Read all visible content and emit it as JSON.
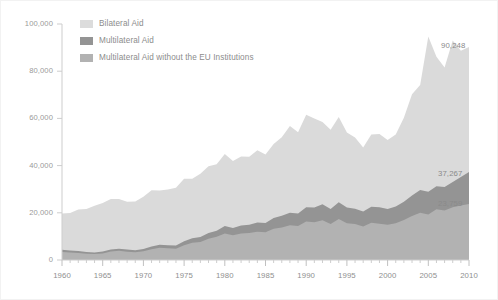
{
  "chart_data": {
    "type": "area",
    "stacked": true,
    "title": "",
    "subtitle": "",
    "xlabel": "",
    "ylabel": "",
    "xlim": [
      1960,
      2010
    ],
    "ylim": [
      0,
      100000
    ],
    "grid": false,
    "legend_position": "top-left",
    "x_ticks": [
      "1960",
      "1965",
      "1970",
      "1975",
      "1980",
      "1985",
      "1990",
      "1995",
      "2000",
      "2005",
      "2010"
    ],
    "x_tick_values": [
      1960,
      1965,
      1970,
      1975,
      1980,
      1985,
      1990,
      1995,
      2000,
      2005,
      2010
    ],
    "x_minor_tick_interval": 1,
    "y_ticks": [
      "0",
      "20,000",
      "40,000",
      "60,000",
      "80,000",
      "100,000"
    ],
    "y_tick_values": [
      0,
      20000,
      40000,
      60000,
      80000,
      100000
    ],
    "x": [
      1960,
      1961,
      1962,
      1963,
      1964,
      1965,
      1966,
      1967,
      1968,
      1969,
      1970,
      1971,
      1972,
      1973,
      1974,
      1975,
      1976,
      1977,
      1978,
      1979,
      1980,
      1981,
      1982,
      1983,
      1984,
      1985,
      1986,
      1987,
      1988,
      1989,
      1990,
      1991,
      1992,
      1993,
      1994,
      1995,
      1996,
      1997,
      1998,
      1999,
      2000,
      2001,
      2002,
      2003,
      2004,
      2005,
      2006,
      2007,
      2008,
      2009,
      2010
    ],
    "series": [
      {
        "name": "Multilateral Aid without the EU Institutions",
        "color": "#b2b2b2",
        "values": [
          3400,
          3200,
          3000,
          2700,
          2500,
          2800,
          3600,
          3900,
          3500,
          3300,
          3700,
          4600,
          5200,
          5000,
          4800,
          6300,
          7300,
          7600,
          9000,
          9800,
          11200,
          10500,
          11200,
          11400,
          12000,
          11800,
          13200,
          13800,
          14700,
          14400,
          16300,
          16000,
          16800,
          15300,
          17400,
          15600,
          15300,
          14200,
          15800,
          15400,
          14900,
          15600,
          17000,
          18600,
          20000,
          19300,
          21500,
          21000,
          22400,
          23100,
          23759
        ]
      },
      {
        "name": "Multilateral Aid",
        "color": "#949494",
        "values": [
          4300,
          4000,
          3800,
          3400,
          3200,
          3600,
          4500,
          4800,
          4400,
          4100,
          4700,
          5700,
          6500,
          6300,
          6100,
          7900,
          9200,
          9700,
          11400,
          12400,
          14400,
          13600,
          14600,
          14900,
          15900,
          15700,
          17800,
          18700,
          20000,
          19700,
          22400,
          22200,
          23600,
          21600,
          24500,
          22200,
          21700,
          20500,
          22600,
          22300,
          21600,
          22700,
          24700,
          27300,
          29700,
          28900,
          31300,
          30900,
          33100,
          35200,
          37267
        ]
      },
      {
        "name": "Bilateral Aid",
        "color": "#dadada",
        "values": [
          15400,
          15900,
          17600,
          18200,
          19800,
          20600,
          21400,
          21100,
          20300,
          20700,
          22100,
          23900,
          23000,
          23600,
          24500,
          26500,
          25200,
          26800,
          28300,
          28200,
          30500,
          28300,
          29300,
          28800,
          30600,
          29000,
          31400,
          33300,
          36800,
          34400,
          39100,
          37800,
          34900,
          33600,
          36100,
          31800,
          30200,
          27200,
          30600,
          31100,
          29300,
          30500,
          35600,
          42900,
          44400,
          65800,
          54800,
          50700,
          59900,
          53500,
          52981
        ]
      }
    ],
    "stack_totals": [
      19700,
      19900,
      21400,
      21600,
      23000,
      24200,
      25900,
      25900,
      24700,
      24800,
      26800,
      29600,
      29500,
      29900,
      30600,
      34400,
      34400,
      36500,
      39700,
      40600,
      44900,
      41900,
      43900,
      43700,
      46500,
      44700,
      49200,
      52000,
      56800,
      54100,
      61500,
      60000,
      58500,
      55200,
      60600,
      54000,
      51900,
      47700,
      53200,
      53400,
      50900,
      53200,
      60300,
      70200,
      74100,
      94700,
      86100,
      81600,
      93000,
      88700,
      90248
    ],
    "value_labels": [
      {
        "text": "90,248",
        "series": "total",
        "year": 2010,
        "value": 90248
      },
      {
        "text": "37,267",
        "series": "Multilateral Aid",
        "year": 2010,
        "value": 37267
      },
      {
        "text": "23,759",
        "series": "Multilateral Aid without the EU Institutions",
        "year": 2010,
        "value": 23759
      }
    ]
  },
  "legend": {
    "items": [
      {
        "label": "Bilateral Aid",
        "color": "#dadada"
      },
      {
        "label": "Multilateral Aid",
        "color": "#949494"
      },
      {
        "label": "Multilateral Aid without the EU Institutions",
        "color": "#b2b2b2"
      }
    ]
  },
  "axis": {
    "y_labels": [
      "100,000",
      "80,000",
      "60,000",
      "40,000",
      "20,000",
      "0"
    ],
    "x_labels": [
      "1960",
      "1965",
      "1970",
      "1975",
      "1980",
      "1985",
      "1990",
      "1995",
      "2000",
      "2005",
      "2010"
    ]
  },
  "value_labels": {
    "total": "90,248",
    "multilateral": "37,267",
    "multilateral_no_eu": "23,759"
  },
  "colors": {
    "bilateral": "#dadada",
    "multilateral": "#949494",
    "multilateral_no_eu": "#b2b2b2",
    "axis": "#c8c8c8",
    "tick_text": "#949494"
  }
}
